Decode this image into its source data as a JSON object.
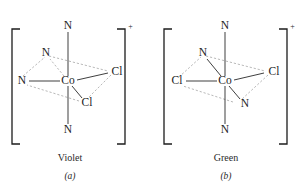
{
  "figure": {
    "background_color": "#ffffff",
    "ink_color": "#1c1c1c",
    "dash_color": "#9a9a9a",
    "complexes": [
      {
        "id": "violet-isomer",
        "caption": "Violet",
        "sub_caption": "(a)",
        "charge": "+",
        "center_label": "Co",
        "ligands": {
          "axial_top": "N",
          "axial_bottom": "N",
          "equatorial_back_left": "N",
          "equatorial_front_left": "N",
          "equatorial_back_right": "Cl",
          "equatorial_front_right": "Cl"
        }
      },
      {
        "id": "green-isomer",
        "caption": "Green",
        "sub_caption": "(b)",
        "charge": "+",
        "center_label": "Co",
        "ligands": {
          "axial_top": "N",
          "axial_bottom": "N",
          "equatorial_back_left": "N",
          "equatorial_front_left": "Cl",
          "equatorial_back_right": "Cl",
          "equatorial_front_right": "N"
        }
      }
    ]
  }
}
